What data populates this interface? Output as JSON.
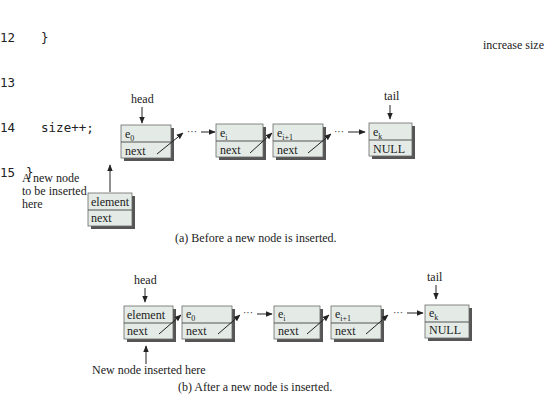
{
  "code": {
    "lines": [
      {
        "number": "12",
        "text": "  }"
      },
      {
        "number": "13",
        "text": ""
      },
      {
        "number": "14",
        "text": "  size++;"
      },
      {
        "number": "15",
        "text": "}"
      }
    ],
    "annotation": "increase size"
  },
  "diagram_a": {
    "head_label": "head",
    "tail_label": "tail",
    "nodes": [
      {
        "value": "e",
        "sub": "0",
        "link": "next"
      },
      {
        "value": "e",
        "sub": "i",
        "link": "next"
      },
      {
        "value": "e",
        "sub": "i+1",
        "link": "next"
      },
      {
        "value": "e",
        "sub": "k",
        "link": "NULL"
      }
    ],
    "ellipsis": "···",
    "new_node": {
      "value": "element",
      "link": "next"
    },
    "new_node_label_lines": [
      "A new node",
      "to be inserted",
      "here"
    ],
    "caption": "(a) Before a new node is inserted."
  },
  "diagram_b": {
    "head_label": "head",
    "tail_label": "tail",
    "nodes": [
      {
        "value": "element",
        "sub": "",
        "link": "next"
      },
      {
        "value": "e",
        "sub": "0",
        "link": "next"
      },
      {
        "value": "e",
        "sub": "i",
        "link": "next"
      },
      {
        "value": "e",
        "sub": "i+1",
        "link": "next"
      },
      {
        "value": "e",
        "sub": "k",
        "link": "NULL"
      }
    ],
    "ellipsis": "···",
    "new_node_label": "New node inserted here",
    "caption": "(b) After a new node is inserted."
  },
  "colors": {
    "node_fill": "#e4ebe6",
    "node_border": "#6a6a6a",
    "node_shadow": "#555555",
    "text": "#222222",
    "arrow": "#222222"
  }
}
